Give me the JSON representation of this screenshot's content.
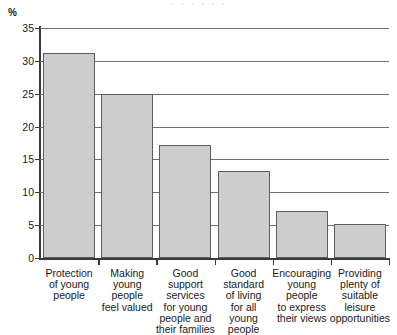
{
  "chart_data": {
    "type": "bar",
    "title": "",
    "xlabel": "",
    "ylabel": "%",
    "ylim": [
      0,
      35
    ],
    "grid": true,
    "legend": null,
    "yticks": [
      0,
      5,
      10,
      15,
      20,
      25,
      30,
      35
    ],
    "ytick_labels": [
      "0",
      "5",
      "10",
      "15",
      "20",
      "25",
      "30",
      "35"
    ],
    "categories": [
      "Protection of young people",
      "Making young people feel valued",
      "Good support services for young people and their families",
      "Good standard of living for all young people",
      "Encouraging young people to express their views",
      "Providing plenty of suitable leisure opportunities"
    ],
    "category_lines": [
      [
        "Protection",
        "of young",
        "people"
      ],
      [
        "Making",
        "young",
        "people",
        "feel valued"
      ],
      [
        "Good",
        "support",
        "services",
        "for young",
        "people and",
        "their families"
      ],
      [
        "Good",
        "standard",
        "of living",
        "for all",
        "young",
        "people"
      ],
      [
        "Encouraging",
        "young",
        "people",
        "to express",
        "their views"
      ],
      [
        "Providing",
        "plenty of",
        "suitable",
        "leisure",
        "opportunities"
      ]
    ],
    "values": [
      31.2,
      25.0,
      17.2,
      13.2,
      7.1,
      5.2
    ],
    "bar_color": "#cdcdcd",
    "bar_edge_color": "#5d5d5d",
    "axis_color": "#3a3a3a",
    "grid_color": "#6f6f6f"
  },
  "axis": {
    "unit_label": "%"
  },
  "title_remnant": "· · ·   · ·   ·"
}
